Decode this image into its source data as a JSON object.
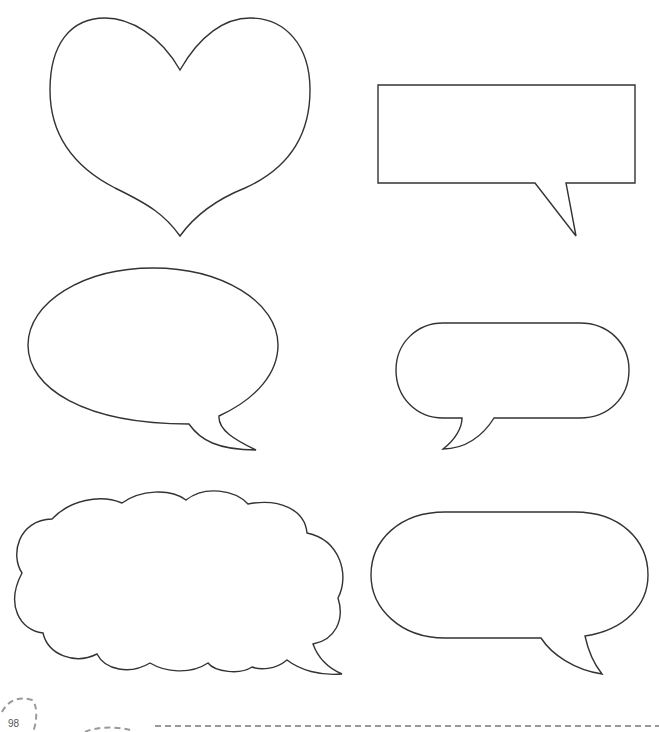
{
  "page": {
    "number": "98",
    "shapes": [
      {
        "id": "heart",
        "type": "heart"
      },
      {
        "id": "rectangle-speech-bubble",
        "type": "rectangle-with-tail"
      },
      {
        "id": "oval-speech-bubble",
        "type": "ellipse-with-tail"
      },
      {
        "id": "small-pill-speech-bubble",
        "type": "pill-with-tail"
      },
      {
        "id": "cloud-thought-bubble",
        "type": "cloud-with-tail"
      },
      {
        "id": "large-pill-speech-bubble",
        "type": "pill-with-tail"
      }
    ],
    "colors": {
      "outline": "#333333",
      "dashes": "#9a9a9a",
      "background": "#ffffff"
    }
  }
}
